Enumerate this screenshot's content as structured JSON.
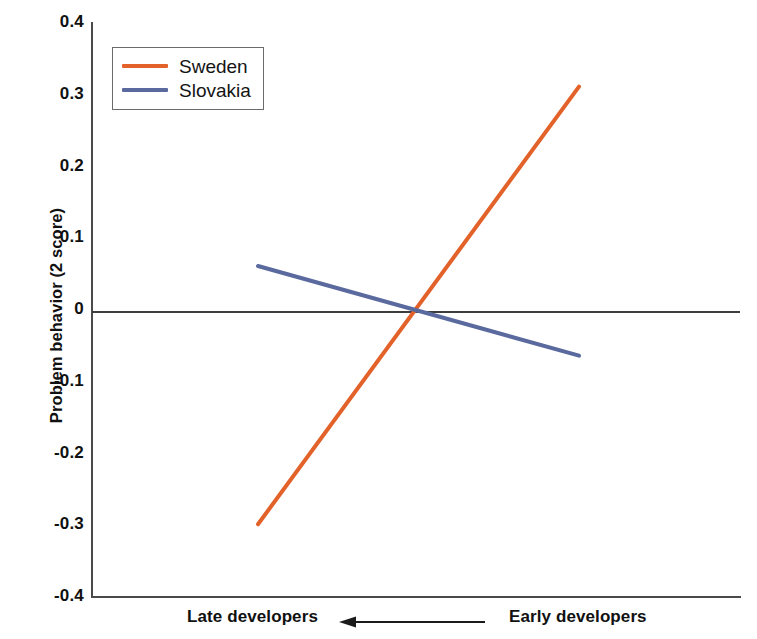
{
  "chart_data": {
    "type": "line",
    "title": "",
    "subtitle": "",
    "xlabel": "",
    "ylabel": "Problem behavior (2 score)",
    "ylim": [
      -0.4,
      0.4
    ],
    "yticks": [
      "0.4",
      "0.3",
      "0.2",
      "0.1",
      "0",
      "-0.1",
      "-0.2",
      "-0.3",
      "-0.4"
    ],
    "ytick_values": [
      0.4,
      0.3,
      0.2,
      0.1,
      0,
      -0.1,
      -0.2,
      -0.3,
      -0.4
    ],
    "grid": false,
    "legend_position": "top-left",
    "x": [
      "Late developers",
      "Early developers"
    ],
    "x_axis_direction_note": "Arrow points from Early developers toward Late developers",
    "zero_reference_line": 0,
    "series": [
      {
        "name": "Sweden",
        "color": "#E2622A",
        "values": [
          -0.3,
          0.31
        ],
        "x_start_label": "Late developers",
        "x_end_label": "Early developers"
      },
      {
        "name": "Slovakia",
        "color": "#5A6A9E",
        "values": [
          0.06,
          -0.065
        ],
        "x_start_label": "Late developers",
        "x_end_label": "Early developers"
      }
    ]
  },
  "legend": {
    "items": [
      {
        "label": "Sweden",
        "color": "#E2622A"
      },
      {
        "label": "Slovakia",
        "color": "#5A6A9E"
      }
    ]
  },
  "axes": {
    "y_title": "Problem behavior (2 score)",
    "y_ticks": [
      "0.4",
      "0.3",
      "0.2",
      "0.1",
      "0",
      "-0.1",
      "-0.2",
      "-0.3",
      "-0.4"
    ],
    "x_left_label": "Late developers",
    "x_right_label": "Early developers",
    "arrow_icon": "left-arrow-icon"
  },
  "background_artifacts": {
    "ghost_1": "",
    "ghost_2": "",
    "ghost_3": ""
  }
}
